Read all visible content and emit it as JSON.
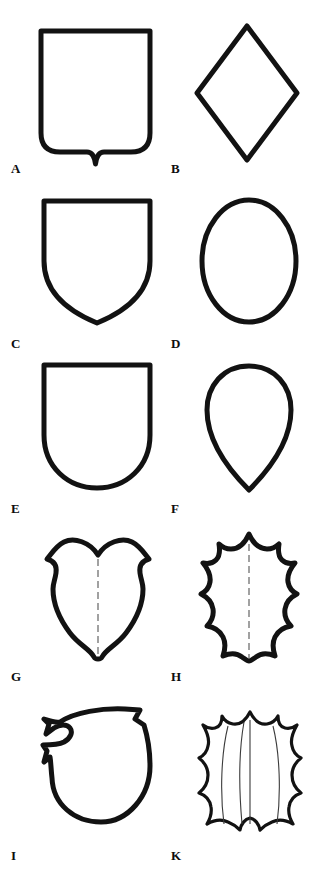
{
  "plate": {
    "title": "Shield shapes plate",
    "background_color": "#ffffff",
    "ink_color": "#121212",
    "width": 317,
    "height": 869,
    "columns": 2,
    "rows": 5
  },
  "figures": [
    {
      "label": "A",
      "name": "square-shield-with-nombril-point",
      "description": "Rectangular shield, rounded lower corners, small V notch at base centre",
      "column": "left",
      "row": 1,
      "label_x": 11,
      "label_y": 162,
      "shape_x": 38,
      "shape_y": 28,
      "shape_w": 115,
      "shape_h": 138
    },
    {
      "label": "B",
      "name": "lozenge-shield",
      "description": "Lozenge (diamond) escutcheon",
      "column": "right",
      "row": 1,
      "label_x": 171,
      "label_y": 162,
      "shape_x": 193,
      "shape_y": 22,
      "shape_w": 106,
      "shape_h": 138
    },
    {
      "label": "C",
      "name": "heater-shield",
      "description": "Heater shield with pointed base",
      "column": "left",
      "row": 2,
      "label_x": 11,
      "label_y": 337,
      "shape_x": 41,
      "shape_y": 198,
      "shape_w": 110,
      "shape_h": 125
    },
    {
      "label": "D",
      "name": "oval-shield",
      "description": "Oval escutcheon",
      "column": "right",
      "row": 2,
      "label_x": 171,
      "label_y": 337,
      "shape_x": 198,
      "shape_y": 196,
      "shape_w": 100,
      "shape_h": 127
    },
    {
      "label": "E",
      "name": "rounded-base-shield",
      "description": "Shield with straight sides and rounded U base",
      "column": "left",
      "row": 3,
      "label_x": 11,
      "label_y": 502,
      "shape_x": 41,
      "shape_y": 362,
      "shape_w": 110,
      "shape_h": 128
    },
    {
      "label": "F",
      "name": "pear-shield",
      "description": "Inverted pear / teardrop escutcheon",
      "column": "right",
      "row": 3,
      "label_x": 171,
      "label_y": 502,
      "shape_x": 203,
      "shape_y": 362,
      "shape_w": 90,
      "shape_h": 130
    },
    {
      "label": "G",
      "name": "baroque-cartouche-shield",
      "description": "Baroque shield with double-lobed chief and scrolled flanks, centre line",
      "column": "left",
      "row": 4,
      "label_x": 11,
      "label_y": 670,
      "shape_x": 41,
      "shape_y": 533,
      "shape_w": 112,
      "shape_h": 125
    },
    {
      "label": "H",
      "name": "scalloped-shield",
      "description": "Shield with cusped, spiked outline and centre line",
      "column": "right",
      "row": 4,
      "label_x": 171,
      "label_y": 670,
      "shape_x": 197,
      "shape_y": 530,
      "shape_w": 102,
      "shape_h": 132
    },
    {
      "label": "I",
      "name": "bouche-shield",
      "description": "Shield à bouche with lance rest notch on dexter flank",
      "column": "left",
      "row": 5,
      "label_x": 11,
      "label_y": 849,
      "shape_x": 40,
      "shape_y": 700,
      "shape_w": 115,
      "shape_h": 125
    },
    {
      "label": "K",
      "name": "scalloped-bouche-shield",
      "description": "Scalloped shield à bouche with three inner field lines",
      "column": "right",
      "row": 5,
      "label_x": 171,
      "label_y": 849,
      "shape_x": 197,
      "shape_y": 698,
      "shape_w": 106,
      "shape_h": 128
    }
  ]
}
